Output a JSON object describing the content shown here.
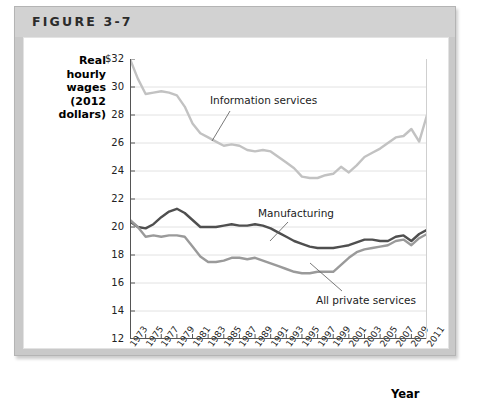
{
  "figure": {
    "title": "FIGURE 3-7"
  },
  "axes": {
    "y_caption_lines": [
      "Real",
      "hourly",
      "wages",
      "(2012",
      "dollars)"
    ],
    "y_caption": "Real hourly wages (2012 dollars)",
    "x_caption": "Year",
    "y_ticks": [
      "$32",
      "30",
      "28",
      "26",
      "24",
      "22",
      "20",
      "18",
      "16",
      "14",
      "12"
    ],
    "x_ticks": [
      "1973",
      "1975",
      "1977",
      "1979",
      "1981",
      "1983",
      "1985",
      "1987",
      "1989",
      "1991",
      "1993",
      "1995",
      "1997",
      "1999",
      "2001",
      "2003",
      "2005",
      "2007",
      "2009",
      "2011"
    ]
  },
  "colors": {
    "information_services": "#c2c2c2",
    "manufacturing": "#4f4f4f",
    "all_private_services": "#9a9a9a",
    "gridline": "#e2e2e2",
    "axis": "#555555",
    "frame_outer": "#c9c9c9",
    "header_band": "#d2d2d2",
    "plot_background": "#ffffff"
  },
  "annotations": [
    {
      "name": "information-services",
      "label": "Information services"
    },
    {
      "name": "manufacturing",
      "label": "Manufacturing"
    },
    {
      "name": "all-private-services",
      "label": "All private services"
    }
  ],
  "chart_data": {
    "type": "line",
    "title": "FIGURE 3-7",
    "xlabel": "Year",
    "ylabel": "Real hourly wages (2012 dollars)",
    "xlim": [
      1973,
      2011
    ],
    "ylim": [
      12,
      32
    ],
    "ytick_step": 2,
    "grid": true,
    "legend": "inline-annotations",
    "x": [
      1973,
      1974,
      1975,
      1976,
      1977,
      1978,
      1979,
      1980,
      1981,
      1982,
      1983,
      1984,
      1985,
      1986,
      1987,
      1988,
      1989,
      1990,
      1991,
      1992,
      1993,
      1994,
      1995,
      1996,
      1997,
      1998,
      1999,
      2000,
      2001,
      2002,
      2003,
      2004,
      2005,
      2006,
      2007,
      2008,
      2009,
      2010,
      2011
    ],
    "series": [
      {
        "name": "Information services",
        "color": "#c2c2c2",
        "values": [
          32.0,
          30.6,
          29.5,
          29.6,
          29.7,
          29.6,
          29.4,
          28.6,
          27.4,
          26.7,
          26.4,
          26.1,
          25.8,
          25.9,
          25.8,
          25.5,
          25.4,
          25.5,
          25.4,
          25.0,
          24.6,
          24.2,
          23.6,
          23.5,
          23.5,
          23.7,
          23.8,
          24.3,
          23.9,
          24.4,
          25.0,
          25.3,
          25.6,
          26.0,
          26.4,
          26.5,
          27.0,
          26.1,
          28.0
        ]
      },
      {
        "name": "Manufacturing",
        "color": "#4f4f4f",
        "values": [
          20.4,
          20.0,
          19.9,
          20.2,
          20.7,
          21.1,
          21.3,
          21.0,
          20.5,
          20.0,
          20.0,
          20.0,
          20.1,
          20.2,
          20.1,
          20.1,
          20.2,
          20.1,
          19.9,
          19.6,
          19.3,
          19.0,
          18.8,
          18.6,
          18.5,
          18.5,
          18.5,
          18.6,
          18.7,
          18.9,
          19.1,
          19.1,
          19.0,
          19.0,
          19.3,
          19.4,
          19.0,
          19.5,
          19.8
        ]
      },
      {
        "name": "All private services",
        "color": "#9a9a9a",
        "values": [
          20.5,
          20.0,
          19.3,
          19.4,
          19.3,
          19.4,
          19.4,
          19.3,
          18.6,
          17.9,
          17.5,
          17.5,
          17.6,
          17.8,
          17.8,
          17.7,
          17.8,
          17.6,
          17.4,
          17.2,
          17.0,
          16.8,
          16.7,
          16.7,
          16.8,
          16.8,
          16.8,
          17.3,
          17.8,
          18.2,
          18.4,
          18.5,
          18.6,
          18.7,
          19.0,
          19.1,
          18.7,
          19.2,
          19.5
        ]
      }
    ]
  }
}
